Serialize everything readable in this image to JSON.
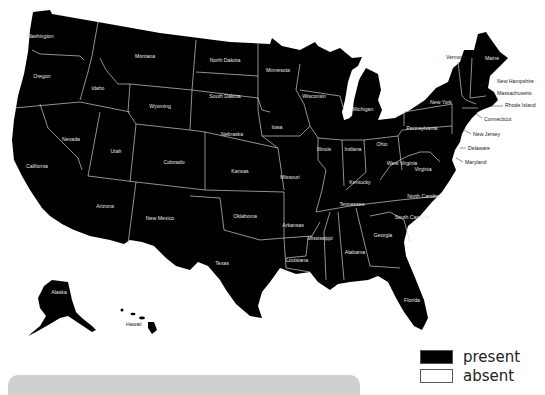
{
  "map": {
    "title": "",
    "fill_present": "#000000",
    "fill_absent": "#ffffff",
    "states": [
      {
        "name": "Washington",
        "x": 40,
        "y": 38,
        "status": "present"
      },
      {
        "name": "Oregon",
        "x": 42,
        "y": 78,
        "status": "present"
      },
      {
        "name": "California",
        "x": 37,
        "y": 168,
        "status": "present"
      },
      {
        "name": "Idaho",
        "x": 98,
        "y": 90,
        "status": "present"
      },
      {
        "name": "Nevada",
        "x": 71,
        "y": 141,
        "status": "present"
      },
      {
        "name": "Montana",
        "x": 145,
        "y": 58,
        "status": "present"
      },
      {
        "name": "Wyoming",
        "x": 160,
        "y": 108,
        "status": "present"
      },
      {
        "name": "Utah",
        "x": 116,
        "y": 153,
        "status": "present"
      },
      {
        "name": "Arizona",
        "x": 105,
        "y": 208,
        "status": "present"
      },
      {
        "name": "Colorado",
        "x": 174,
        "y": 164,
        "status": "present"
      },
      {
        "name": "New Mexico",
        "x": 160,
        "y": 220,
        "status": "present"
      },
      {
        "name": "North Dakota",
        "x": 225,
        "y": 62,
        "status": "present"
      },
      {
        "name": "South Dakota",
        "x": 225,
        "y": 98,
        "status": "present"
      },
      {
        "name": "Nebraska",
        "x": 232,
        "y": 136,
        "status": "present"
      },
      {
        "name": "Kansas",
        "x": 240,
        "y": 173,
        "status": "present"
      },
      {
        "name": "Oklahoma",
        "x": 245,
        "y": 218,
        "status": "present"
      },
      {
        "name": "Texas",
        "x": 222,
        "y": 265,
        "status": "present"
      },
      {
        "name": "Minnesota",
        "x": 278,
        "y": 72,
        "status": "present"
      },
      {
        "name": "Iowa",
        "x": 277,
        "y": 129,
        "status": "present"
      },
      {
        "name": "Missouri",
        "x": 290,
        "y": 179,
        "status": "present"
      },
      {
        "name": "Arkansas",
        "x": 293,
        "y": 227,
        "status": "present"
      },
      {
        "name": "Louisiana",
        "x": 297,
        "y": 262,
        "status": "present"
      },
      {
        "name": "Wisconsin",
        "x": 314,
        "y": 98,
        "status": "present"
      },
      {
        "name": "Illinois",
        "x": 324,
        "y": 151,
        "status": "present"
      },
      {
        "name": "Michigan",
        "x": 363,
        "y": 111,
        "status": "present"
      },
      {
        "name": "Indiana",
        "x": 353,
        "y": 151,
        "status": "present"
      },
      {
        "name": "Ohio",
        "x": 382,
        "y": 146,
        "status": "present"
      },
      {
        "name": "Kentucky",
        "x": 360,
        "y": 184,
        "status": "present"
      },
      {
        "name": "Tennessee",
        "x": 352,
        "y": 206,
        "status": "present"
      },
      {
        "name": "Mississippi",
        "x": 320,
        "y": 240,
        "status": "present"
      },
      {
        "name": "Alabama",
        "x": 355,
        "y": 254,
        "status": "present"
      },
      {
        "name": "Georgia",
        "x": 383,
        "y": 237,
        "status": "present"
      },
      {
        "name": "Florida",
        "x": 412,
        "y": 302,
        "status": "present"
      },
      {
        "name": "South Carolina",
        "x": 412,
        "y": 219,
        "status": "present"
      },
      {
        "name": "North Carolina",
        "x": 424,
        "y": 198,
        "status": "present"
      },
      {
        "name": "Virginia",
        "x": 423,
        "y": 171,
        "status": "present"
      },
      {
        "name": "West Virginia",
        "x": 402,
        "y": 165,
        "status": "present"
      },
      {
        "name": "Pennsylvania",
        "x": 422,
        "y": 130,
        "status": "present"
      },
      {
        "name": "New York",
        "x": 441,
        "y": 104,
        "status": "present"
      },
      {
        "name": "Alaska",
        "x": 59,
        "y": 294,
        "status": "present"
      },
      {
        "name": "Hawaii",
        "x": 132,
        "y": 323,
        "status": "present"
      }
    ],
    "outside_labels": [
      {
        "name": "Vermont",
        "x": 446,
        "y": 59,
        "status": "present"
      },
      {
        "name": "Maine",
        "x": 489,
        "y": 58,
        "status": "present"
      },
      {
        "name": "New Hampshire",
        "x": 497,
        "y": 83,
        "status": "present"
      },
      {
        "name": "Massachusetts",
        "x": 497,
        "y": 95,
        "status": "present"
      },
      {
        "name": "Rhode Island",
        "x": 505,
        "y": 106,
        "status": "present"
      },
      {
        "name": "Connecticut",
        "x": 484,
        "y": 120,
        "status": "present"
      },
      {
        "name": "New Jersey",
        "x": 473,
        "y": 135,
        "status": "present"
      },
      {
        "name": "Delaware",
        "x": 468,
        "y": 149,
        "status": "present"
      },
      {
        "name": "Maryland",
        "x": 465,
        "y": 163,
        "status": "present"
      }
    ]
  },
  "legend": {
    "items": [
      {
        "label": "present",
        "color": "#000000"
      },
      {
        "label": "absent",
        "color": "#ffffff"
      }
    ]
  }
}
